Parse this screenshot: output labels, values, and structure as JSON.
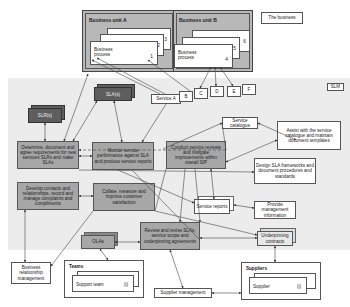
{
  "diagram": {
    "business": {
      "label": "The business",
      "unit_a": {
        "title": "Business unit A",
        "process_label": "Business process",
        "numbers": [
          "1",
          "2",
          "3"
        ]
      },
      "unit_b": {
        "title": "Business unit B",
        "process_label": "Business process",
        "numbers": [
          "4",
          "5",
          "6"
        ]
      }
    },
    "slm_label": "SLM",
    "services": [
      "Service A",
      "B",
      "C",
      "D",
      "E",
      "F"
    ],
    "agreements": {
      "slas": "SLA(s)",
      "slrs": "SLR(s)",
      "olas": "OLAs"
    },
    "activities": {
      "determine": "Determine, document and agree requirements for new services SLRs and make SLAs",
      "monitor": "Monitor service performance against SLA and produce service reports",
      "conduct": "Conduct service reviews and instigate improvements within overall SIP",
      "develop": "Develop contacts and relationships, record and manage complaints and compliments",
      "collate": "Collate, measure and improve customer satisfaction",
      "review": "Review and revise SLAs, service scope and underpinning agreements"
    },
    "outputs": {
      "service_catalogue": "Service catalogue",
      "assist": "Assist with the service catalogue and maintain document templates",
      "design_sla": "Design SLA frameworks and document procedures and standards",
      "service_reports": "Service reports",
      "provide_mi": "Provide management information",
      "underpinning": "Underpinning contracts"
    },
    "external": {
      "brm": "Business relationship management",
      "teams_title": "Teams",
      "support_team": "Support team",
      "support_idx": "(i)",
      "supplier_mgmt": "Supplier management",
      "suppliers_title": "Suppliers",
      "supplier": "Supplier",
      "supplier_idx": "(i)"
    },
    "colors": {
      "activity_fill": "#a7a7a7",
      "agreement_fill": "#5e5e5e",
      "slm_band": "#ececec",
      "unit_fill": "#b8b8b8"
    }
  }
}
